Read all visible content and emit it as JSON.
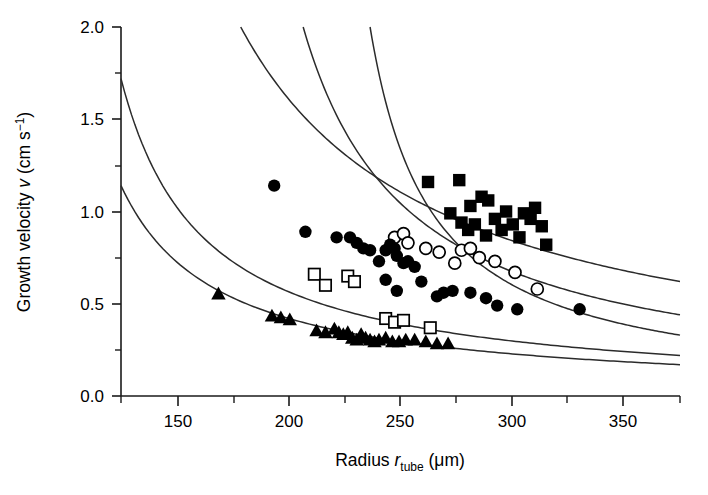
{
  "chart_data": {
    "type": "scatter",
    "title": "",
    "xlabel": "Radius r_tube (μm)",
    "xlabel_parts": {
      "lead": "Radius ",
      "symbol": "r",
      "subscript": "tube",
      "units": " (μm)"
    },
    "ylabel": "Growth velocity v (cm s⁻¹)",
    "ylabel_parts": {
      "lead": "Growth velocity ",
      "symbol": "v",
      "units_open": " (cm s",
      "exponent": "−1",
      "units_close": ")"
    },
    "xlim": [
      124.3,
      375.0
    ],
    "ylim": [
      0.0,
      2.0
    ],
    "xticks": [
      150,
      200,
      250,
      300,
      350
    ],
    "xtick_labels": [
      "150",
      "200",
      "250",
      "300",
      "350"
    ],
    "xminor_ticks": [
      175,
      225,
      275,
      325,
      375
    ],
    "yticks": [
      0.0,
      0.5,
      1.0,
      1.5,
      2.0
    ],
    "ytick_labels": [
      "0.0",
      "0.5",
      "1.0",
      "1.5",
      "2.0"
    ],
    "yminor_ticks": [
      0.25,
      0.75,
      1.25,
      1.75
    ],
    "grid": false,
    "legend": "none",
    "axis_color": "#1a1a1a",
    "marker_color": "#000000",
    "curve_color": "#2b2b2b",
    "background": "#ffffff",
    "series": [
      {
        "name": "filled-squares",
        "marker": "filled-square",
        "points": [
          [
            262,
            1.16
          ],
          [
            276,
            1.17
          ],
          [
            281,
            1.03
          ],
          [
            286,
            1.08
          ],
          [
            272,
            0.99
          ],
          [
            277,
            0.94
          ],
          [
            283,
            0.93
          ],
          [
            289,
            1.06
          ],
          [
            292,
            0.96
          ],
          [
            295,
            0.9
          ],
          [
            297,
            1.0
          ],
          [
            300,
            0.93
          ],
          [
            303,
            0.86
          ],
          [
            305,
            0.99
          ],
          [
            308,
            0.96
          ],
          [
            310,
            1.02
          ],
          [
            313,
            0.92
          ],
          [
            315,
            0.82
          ],
          [
            288,
            0.87
          ],
          [
            280,
            0.9
          ]
        ]
      },
      {
        "name": "open-circles",
        "marker": "open-circle",
        "points": [
          [
            247,
            0.86
          ],
          [
            251,
            0.88
          ],
          [
            253,
            0.83
          ],
          [
            261,
            0.8
          ],
          [
            267,
            0.78
          ],
          [
            277,
            0.79
          ],
          [
            281,
            0.8
          ],
          [
            285,
            0.75
          ],
          [
            274,
            0.72
          ],
          [
            292,
            0.73
          ],
          [
            301,
            0.67
          ],
          [
            311,
            0.58
          ]
        ]
      },
      {
        "name": "filled-circles",
        "marker": "filled-circle",
        "points": [
          [
            193,
            1.14
          ],
          [
            207,
            0.89
          ],
          [
            221,
            0.86
          ],
          [
            227,
            0.86
          ],
          [
            230,
            0.83
          ],
          [
            233,
            0.8
          ],
          [
            236,
            0.79
          ],
          [
            240,
            0.73
          ],
          [
            243,
            0.79
          ],
          [
            245,
            0.82
          ],
          [
            247,
            0.8
          ],
          [
            248,
            0.76
          ],
          [
            251,
            0.72
          ],
          [
            253,
            0.73
          ],
          [
            256,
            0.7
          ],
          [
            243,
            0.63
          ],
          [
            248,
            0.57
          ],
          [
            259,
            0.62
          ],
          [
            266,
            0.54
          ],
          [
            269,
            0.56
          ],
          [
            273,
            0.57
          ],
          [
            281,
            0.56
          ],
          [
            288,
            0.53
          ],
          [
            293,
            0.49
          ],
          [
            302,
            0.47
          ],
          [
            330,
            0.47
          ]
        ]
      },
      {
        "name": "open-squares",
        "marker": "open-square",
        "points": [
          [
            211,
            0.66
          ],
          [
            216,
            0.6
          ],
          [
            226,
            0.65
          ],
          [
            229,
            0.62
          ],
          [
            243,
            0.42
          ],
          [
            247,
            0.4
          ],
          [
            251,
            0.41
          ],
          [
            263,
            0.37
          ]
        ]
      },
      {
        "name": "filled-triangles",
        "marker": "filled-triangle",
        "points": [
          [
            168,
            0.55
          ],
          [
            192,
            0.43
          ],
          [
            196,
            0.42
          ],
          [
            200,
            0.41
          ],
          [
            212,
            0.35
          ],
          [
            216,
            0.34
          ],
          [
            220,
            0.36
          ],
          [
            222,
            0.34
          ],
          [
            224,
            0.33
          ],
          [
            226,
            0.34
          ],
          [
            228,
            0.31
          ],
          [
            230,
            0.3
          ],
          [
            232,
            0.33
          ],
          [
            234,
            0.31
          ],
          [
            236,
            0.3
          ],
          [
            238,
            0.29
          ],
          [
            240,
            0.3
          ],
          [
            243,
            0.31
          ],
          [
            246,
            0.29
          ],
          [
            249,
            0.29
          ],
          [
            252,
            0.3
          ],
          [
            256,
            0.3
          ],
          [
            261,
            0.29
          ],
          [
            266,
            0.28
          ],
          [
            271,
            0.28
          ]
        ]
      }
    ],
    "curves": [
      {
        "name": "curve-1",
        "description": "topmost model curve, enters top edge",
        "x_start": 178.0,
        "y_at_x_start": 2.0,
        "x_end": 375.0,
        "y_at_x_end": 0.62,
        "constant": 232.5
      },
      {
        "name": "curve-2",
        "description": "second model curve, enters top edge",
        "x_start": 206.0,
        "y_at_x_start": 2.0,
        "x_end": 375.0,
        "y_at_x_end": 0.44,
        "constant": 166.0
      },
      {
        "name": "curve-3",
        "description": "third model curve, enters top edge",
        "x_start": 236.0,
        "y_at_x_start": 2.0,
        "x_end": 375.0,
        "y_at_x_end": 0.33,
        "constant": 124.0
      },
      {
        "name": "curve-4",
        "description": "fourth model curve, starts at left axis",
        "x_start": 124.3,
        "y_at_x_start": 1.72,
        "x_end": 375.0,
        "y_at_x_end": 0.22,
        "constant": 84.0
      },
      {
        "name": "curve-5",
        "description": "lowest model curve, starts at left axis",
        "x_start": 124.3,
        "y_at_x_start": 1.14,
        "x_end": 375.0,
        "y_at_x_end": 0.17,
        "constant": 63.0
      }
    ]
  }
}
